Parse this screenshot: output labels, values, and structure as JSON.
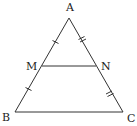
{
  "diagram": {
    "type": "triangle-midsegment",
    "stroke_color": "#333333",
    "points": {
      "A": {
        "label": "A",
        "x": 69,
        "y": 18,
        "label_x": 66,
        "label_y": 11
      },
      "B": {
        "label": "B",
        "x": 15,
        "y": 112,
        "label_x": 2,
        "label_y": 121
      },
      "C": {
        "label": "C",
        "x": 123,
        "y": 112,
        "label_x": 127,
        "label_y": 122
      },
      "M": {
        "label": "M",
        "x": 42,
        "y": 66,
        "label_x": 26,
        "label_y": 70
      },
      "N": {
        "label": "N",
        "x": 96,
        "y": 66,
        "label_x": 101,
        "label_y": 70
      }
    },
    "segments": [
      "AB",
      "AC",
      "BC",
      "MN"
    ],
    "tick_marks": [
      {
        "segment": "AM",
        "count": 1
      },
      {
        "segment": "MB",
        "count": 1
      },
      {
        "segment": "AN",
        "count": 2
      },
      {
        "segment": "NC",
        "count": 2
      }
    ]
  }
}
